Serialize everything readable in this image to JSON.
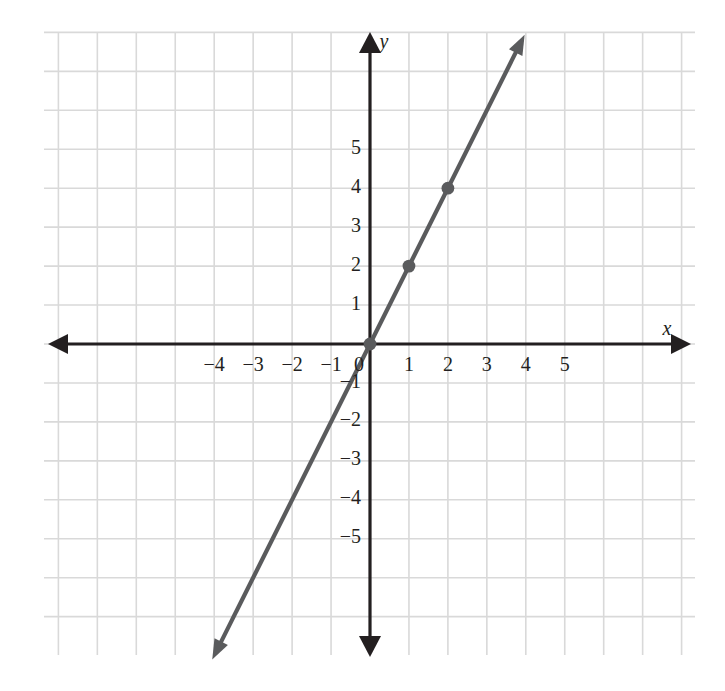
{
  "chart_data": {
    "type": "line",
    "title": "",
    "subtitle": "",
    "xlabel": "x",
    "ylabel": "y",
    "xlim": [
      -5,
      6
    ],
    "ylim": [
      -8,
      8
    ],
    "grid": true,
    "legend": null,
    "equation": "y = 2x",
    "slope": 2,
    "intercept": 0,
    "x_tick_labels": [
      "−4",
      "−3",
      "−2",
      "−1",
      "0",
      "1",
      "2",
      "3",
      "4",
      "5"
    ],
    "x_tick_values": [
      -4,
      -3,
      -2,
      -1,
      0,
      1,
      2,
      3,
      4,
      5
    ],
    "y_tick_labels": [
      "5",
      "4",
      "3",
      "2",
      "1",
      "−1",
      "−2",
      "−3",
      "−4",
      "−5"
    ],
    "y_tick_values": [
      5,
      4,
      3,
      2,
      1,
      -1,
      -2,
      -3,
      -4,
      -5
    ],
    "origin_label": "0",
    "series": [
      {
        "name": "y = 2x",
        "color": "#5a5b5d",
        "arrow_start": true,
        "arrow_end": true,
        "line_from": [
          -4.05,
          -8.1
        ],
        "line_to": [
          3.97,
          7.94
        ],
        "points": [
          {
            "x": 0,
            "y": 0
          },
          {
            "x": 1,
            "y": 2
          },
          {
            "x": 2,
            "y": 4
          }
        ]
      }
    ],
    "colors": {
      "axis": "#231f20",
      "grid": "#d9d9d9",
      "line": "#5a5b5d",
      "point": "#5a5b5d",
      "background": "#ffffff"
    }
  },
  "axis_labels": {
    "x": "x",
    "y": "y"
  }
}
